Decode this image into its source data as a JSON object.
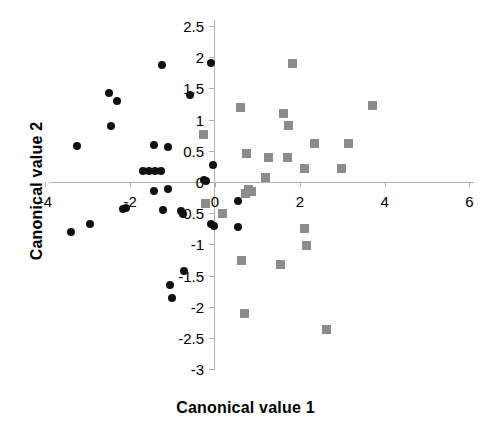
{
  "chart_data": {
    "type": "scatter",
    "title": "",
    "xlabel": "Canonical value 1",
    "ylabel": "Canonical value 2",
    "xlim": [
      -4,
      6
    ],
    "ylim": [
      -3,
      2.5
    ],
    "xticks": [
      -4,
      -2,
      0,
      2,
      4,
      6
    ],
    "xticklabels": [
      "-4",
      "-2",
      "0",
      "2",
      "4",
      "6"
    ],
    "yticks": [
      2.5,
      2,
      1.5,
      1,
      0.5,
      0,
      -0.5,
      -1,
      -1.5,
      -2,
      -2.5,
      -3
    ],
    "yticklabels": [
      "2.5",
      "2",
      "1.5",
      "1",
      "0.5",
      "0",
      "-0.5",
      "-1",
      "-1.5",
      "-2",
      "-2.5",
      "-3"
    ],
    "grid": false,
    "legend": "none",
    "series": [
      {
        "name": "group-1",
        "marker": "circle",
        "color": "#111111",
        "points": [
          [
            -1.25,
            1.87
          ],
          [
            -0.1,
            1.9
          ],
          [
            -2.5,
            1.43
          ],
          [
            -2.3,
            1.3
          ],
          [
            -0.6,
            1.4
          ],
          [
            -2.45,
            0.9
          ],
          [
            -3.25,
            0.57
          ],
          [
            -1.45,
            0.6
          ],
          [
            -1.1,
            0.56
          ],
          [
            -1.7,
            0.17
          ],
          [
            -1.55,
            0.17
          ],
          [
            -1.42,
            0.17
          ],
          [
            -1.28,
            0.17
          ],
          [
            -0.22,
            0.02
          ],
          [
            -0.25,
            0.03
          ],
          [
            -0.05,
            0.28
          ],
          [
            -1.45,
            -0.15
          ],
          [
            -1.1,
            -0.12
          ],
          [
            -2.1,
            -0.42
          ],
          [
            -2.18,
            -0.44
          ],
          [
            -1.22,
            -0.45
          ],
          [
            -0.8,
            -0.46
          ],
          [
            -0.75,
            -0.52
          ],
          [
            -0.1,
            -0.68
          ],
          [
            -0.02,
            -0.7
          ],
          [
            0.55,
            -0.3
          ],
          [
            0.55,
            -0.72
          ],
          [
            -3.4,
            -0.8
          ],
          [
            -2.95,
            -0.67
          ],
          [
            -0.72,
            -1.42
          ],
          [
            -1.05,
            -1.65
          ],
          [
            -1.02,
            -1.86
          ]
        ]
      },
      {
        "name": "group-2",
        "marker": "square",
        "color": "#8c8c8c",
        "points": [
          [
            1.82,
            1.9
          ],
          [
            0.6,
            1.2
          ],
          [
            3.72,
            1.22
          ],
          [
            1.62,
            1.1
          ],
          [
            1.73,
            0.9
          ],
          [
            -0.28,
            0.76
          ],
          [
            2.35,
            0.61
          ],
          [
            3.15,
            0.62
          ],
          [
            0.75,
            0.45
          ],
          [
            1.27,
            0.4
          ],
          [
            1.7,
            0.4
          ],
          [
            2.1,
            0.22
          ],
          [
            2.98,
            0.22
          ],
          [
            1.2,
            0.08
          ],
          [
            0.8,
            -0.12
          ],
          [
            0.72,
            -0.18
          ],
          [
            0.85,
            -0.16
          ],
          [
            -0.22,
            -0.35
          ],
          [
            0.18,
            -0.5
          ],
          [
            2.12,
            -0.75
          ],
          [
            2.15,
            -1.02
          ],
          [
            0.62,
            -1.25
          ],
          [
            1.55,
            -1.33
          ],
          [
            0.7,
            -2.1
          ],
          [
            2.62,
            -2.36
          ]
        ]
      }
    ]
  },
  "axes": {
    "x_title": "Canonical value 1",
    "y_title": "Canonical value 2"
  }
}
